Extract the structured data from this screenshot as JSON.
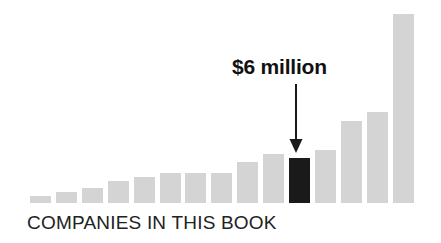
{
  "chart_data": {
    "type": "bar",
    "title": "",
    "subtitle": "",
    "xlabel": "COMPANIES IN THIS BOOK",
    "ylabel": "",
    "grid": false,
    "legend": null,
    "axis_visible": false,
    "ylim": [
      0,
      26
    ],
    "categories": [
      "1",
      "2",
      "3",
      "4",
      "5",
      "6",
      "7",
      "8",
      "9",
      "10",
      "11",
      "12",
      "13",
      "14",
      "15"
    ],
    "values": [
      1,
      1.5,
      2,
      3,
      3.5,
      4,
      4,
      4,
      5.5,
      6.6,
      6,
      7.2,
      11,
      12.2,
      25.5
    ],
    "value_unit": "million",
    "bar_color": "#d4d4d4",
    "highlight_color": "#1a1a1a",
    "highlighted_index": 10,
    "annotations": [
      {
        "text": "$6 million",
        "target_index": 10,
        "type": "arrow-down"
      }
    ]
  },
  "annotation": {
    "label": "$6 million"
  },
  "caption": {
    "text": "COMPANIES IN THIS BOOK"
  },
  "colors": {
    "bar": "#d4d4d4",
    "highlight": "#1a1a1a",
    "text": "#111111",
    "caption": "#222222",
    "background": "#ffffff"
  }
}
